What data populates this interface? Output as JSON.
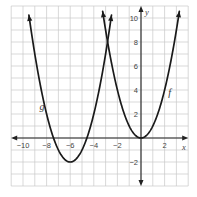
{
  "chart_data": {
    "type": "line",
    "title": "",
    "xlabel": "x",
    "ylabel": "y",
    "xlim": [
      -11,
      4
    ],
    "ylim": [
      -4,
      11
    ],
    "grid": true,
    "legend": "none (curves labeled inline)",
    "x_ticks": [
      {
        "value": -10,
        "label": "−10"
      },
      {
        "value": -8,
        "label": "−8"
      },
      {
        "value": -6,
        "label": "−6"
      },
      {
        "value": -4,
        "label": "−4"
      },
      {
        "value": -2,
        "label": "−2"
      },
      {
        "value": 2,
        "label": "2"
      }
    ],
    "y_ticks": [
      {
        "value": 10,
        "label": "10"
      },
      {
        "value": 8,
        "label": "8"
      },
      {
        "value": 6,
        "label": "6"
      },
      {
        "value": 4,
        "label": "4"
      },
      {
        "value": 2,
        "label": "2"
      },
      {
        "value": -2,
        "label": "−2"
      }
    ],
    "series": [
      {
        "name": "f",
        "equation": "f(x) = x^2",
        "vertex": [
          0,
          0
        ],
        "x": [
          -3.25,
          -3,
          -2,
          -1,
          0,
          1,
          2,
          3,
          3.25
        ],
        "y": [
          10.56,
          9,
          4,
          1,
          0,
          1,
          4,
          9,
          10.56
        ],
        "label_pos": [
          2.3,
          3.5
        ]
      },
      {
        "name": "g",
        "equation": "g(x) = (x+6)^2 - 2",
        "vertex": [
          -6,
          -2
        ],
        "x": [
          -9.5,
          -9,
          -8,
          -7,
          -6,
          -5,
          -4,
          -3,
          -2.5
        ],
        "y": [
          10.25,
          7,
          2,
          -1,
          -2,
          -1,
          2,
          7,
          10.25
        ],
        "label_pos": [
          -8.6,
          2.3
        ]
      }
    ],
    "intersection": [
      -2.83,
      8.03
    ],
    "annotations": [
      "f",
      "g"
    ]
  },
  "labels": {
    "x_axis": "x",
    "y_axis": "y",
    "f": "f",
    "g": "g"
  }
}
